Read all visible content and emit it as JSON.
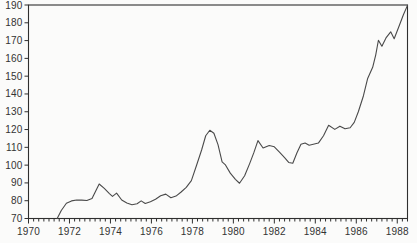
{
  "chart_data": {
    "type": "line",
    "title": "",
    "xlabel": "",
    "ylabel": "",
    "legend": "none",
    "grid": "off",
    "x_range": [
      1970,
      1988.5
    ],
    "y_range": [
      70,
      190
    ],
    "x_tick_labels": [
      "1970",
      "1972",
      "1974",
      "1976",
      "1978",
      "1980",
      "1982",
      "1984",
      "1986",
      "1988"
    ],
    "x_label_years": [
      1970,
      1972,
      1974,
      1976,
      1978,
      1980,
      1982,
      1984,
      1986,
      1988
    ],
    "x_minor_tick_step": 0.25,
    "y_tick_step": 10,
    "y_tick_labels": [
      "190",
      "180",
      "170",
      "160",
      "150",
      "140",
      "130",
      "120",
      "110",
      "100",
      "90",
      "80",
      "70"
    ],
    "y_tick_values": [
      190,
      180,
      170,
      160,
      150,
      140,
      130,
      120,
      110,
      100,
      90,
      80,
      70
    ],
    "colors": {
      "line": "#4a4a4a",
      "axis": "#2f2f2f",
      "tick": "#2f2f2f",
      "text": "#333333",
      "plot_background": "#fbfbfa"
    },
    "series": [
      {
        "name": "index",
        "points": [
          [
            1971.4,
            70.0
          ],
          [
            1971.6,
            74.5
          ],
          [
            1971.85,
            78.6
          ],
          [
            1972.1,
            79.9
          ],
          [
            1972.35,
            80.4
          ],
          [
            1972.6,
            80.3
          ],
          [
            1972.85,
            80.1
          ],
          [
            1973.1,
            81.2
          ],
          [
            1973.45,
            89.4
          ],
          [
            1973.7,
            86.9
          ],
          [
            1973.95,
            84.0
          ],
          [
            1974.1,
            82.4
          ],
          [
            1974.3,
            84.3
          ],
          [
            1974.55,
            80.4
          ],
          [
            1974.8,
            78.7
          ],
          [
            1975.05,
            77.7
          ],
          [
            1975.3,
            78.3
          ],
          [
            1975.5,
            79.9
          ],
          [
            1975.7,
            78.4
          ],
          [
            1975.95,
            79.4
          ],
          [
            1976.2,
            80.8
          ],
          [
            1976.45,
            82.8
          ],
          [
            1976.7,
            83.7
          ],
          [
            1976.95,
            81.7
          ],
          [
            1977.2,
            82.6
          ],
          [
            1977.45,
            84.9
          ],
          [
            1977.7,
            87.5
          ],
          [
            1977.95,
            91.3
          ],
          [
            1978.2,
            99.8
          ],
          [
            1978.45,
            108.5
          ],
          [
            1978.65,
            116.5
          ],
          [
            1978.85,
            119.6
          ],
          [
            1979.05,
            117.9
          ],
          [
            1979.25,
            111.5
          ],
          [
            1979.45,
            101.8
          ],
          [
            1979.6,
            100.3
          ],
          [
            1979.85,
            95.5
          ],
          [
            1980.1,
            92.0
          ],
          [
            1980.3,
            89.8
          ],
          [
            1980.55,
            94.0
          ],
          [
            1980.8,
            101.0
          ],
          [
            1981.0,
            107.0
          ],
          [
            1981.2,
            113.8
          ],
          [
            1981.45,
            109.6
          ],
          [
            1981.75,
            111.0
          ],
          [
            1982.0,
            110.3
          ],
          [
            1982.25,
            107.3
          ],
          [
            1982.5,
            104.2
          ],
          [
            1982.7,
            101.5
          ],
          [
            1982.9,
            101.1
          ],
          [
            1983.1,
            106.8
          ],
          [
            1983.3,
            111.7
          ],
          [
            1983.5,
            112.4
          ],
          [
            1983.7,
            111.2
          ],
          [
            1983.95,
            111.9
          ],
          [
            1984.15,
            112.4
          ],
          [
            1984.4,
            116.5
          ],
          [
            1984.65,
            122.4
          ],
          [
            1984.95,
            120.1
          ],
          [
            1985.2,
            121.9
          ],
          [
            1985.45,
            120.4
          ],
          [
            1985.7,
            121.0
          ],
          [
            1985.9,
            124.0
          ],
          [
            1986.1,
            130.0
          ],
          [
            1986.35,
            139.0
          ],
          [
            1986.55,
            148.5
          ],
          [
            1986.8,
            155.0
          ],
          [
            1986.95,
            162.0
          ],
          [
            1987.08,
            170.2
          ],
          [
            1987.25,
            166.8
          ],
          [
            1987.45,
            171.5
          ],
          [
            1987.68,
            174.9
          ],
          [
            1987.85,
            171.0
          ],
          [
            1988.1,
            178.5
          ],
          [
            1988.3,
            184.5
          ],
          [
            1988.5,
            189.8
          ]
        ]
      }
    ]
  }
}
